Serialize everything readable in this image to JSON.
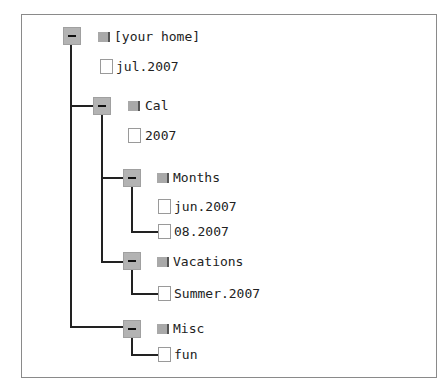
{
  "tree": {
    "root": {
      "label": "[your home]",
      "type": "folder",
      "expanded": true
    },
    "items": [
      {
        "label": "jul.2007",
        "type": "file"
      },
      {
        "label": "Cal",
        "type": "folder",
        "expanded": true
      },
      {
        "label": "2007",
        "type": "file"
      },
      {
        "label": "Months",
        "type": "folder",
        "expanded": true
      },
      {
        "label": "jun.2007",
        "type": "file"
      },
      {
        "label": "08.2007",
        "type": "file"
      },
      {
        "label": "Vacations",
        "type": "folder",
        "expanded": true
      },
      {
        "label": "Summer.2007",
        "type": "file"
      },
      {
        "label": "Misc",
        "type": "folder",
        "expanded": true
      },
      {
        "label": "fun",
        "type": "file"
      }
    ]
  },
  "colors": {
    "toggle": "#b3b3b3",
    "folder": "#a9a9a9",
    "line": "#222222",
    "border": "#8a8a8a"
  }
}
